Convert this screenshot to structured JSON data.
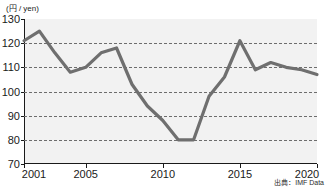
{
  "chart_data": {
    "type": "line",
    "title": "",
    "subtitle": "",
    "xlabel": "",
    "ylabel": "(円 / yen)",
    "unit_caption": "(円 / yen)",
    "source": "出典：IMF Data",
    "x": [
      2001,
      2002,
      2003,
      2004,
      2005,
      2006,
      2007,
      2008,
      2009,
      2010,
      2011,
      2012,
      2013,
      2014,
      2015,
      2016,
      2017,
      2018,
      2019,
      2020
    ],
    "values": [
      121,
      125,
      116,
      108,
      110,
      116,
      118,
      103,
      94,
      88,
      80,
      80,
      98,
      106,
      121,
      109,
      112,
      110,
      109,
      107
    ],
    "series": [
      {
        "name": "円 / yen",
        "values": [
          121,
          125,
          116,
          108,
          110,
          116,
          118,
          103,
          94,
          88,
          80,
          80,
          98,
          106,
          121,
          109,
          112,
          110,
          109,
          107
        ]
      }
    ],
    "xlim": [
      2001,
      2020
    ],
    "ylim": [
      70,
      130
    ],
    "ytick_labels": [
      "130",
      "120",
      "110",
      "100",
      "90",
      "80",
      "70"
    ],
    "ytick_values": [
      130,
      120,
      110,
      100,
      90,
      80,
      70
    ],
    "xtick_labels": [
      "2001",
      "2005",
      "2010",
      "2015",
      "2020"
    ],
    "xtick_values": [
      2001,
      2005,
      2010,
      2015,
      2020
    ],
    "grid": true,
    "grid_style": "dashed-horizontal",
    "legend": false,
    "legend_position": "none",
    "line_color": "#6f6f6f",
    "plot_background": "#f2f2f2",
    "axis_color": "#1a1a1a"
  }
}
